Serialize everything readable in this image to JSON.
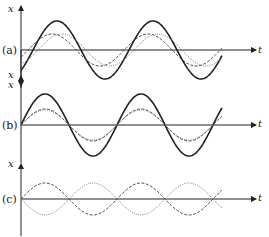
{
  "figure": {
    "panels": [
      {
        "id": "a",
        "label": "(a)",
        "y_axis_label": "x",
        "x_axis_label": "t",
        "description": "Two waves with a phase difference and their resultant (solid)",
        "axis_y": 50,
        "curves": [
          {
            "name": "resultant",
            "style": "solid",
            "amplitude": 29,
            "phase": 0.25
          },
          {
            "name": "wave-1",
            "style": "dashed",
            "amplitude": 16,
            "phase": 0.15
          },
          {
            "name": "wave-2",
            "style": "dotted",
            "amplitude": 16,
            "phase": 0.35
          }
        ]
      },
      {
        "id": "b",
        "label": "(b)",
        "y_axis_label": "x",
        "x_axis_label": "t",
        "description": "Two waves in phase (constructive interference) and their resultant (solid)",
        "axis_y": 125,
        "curves": [
          {
            "name": "resultant",
            "style": "solid",
            "amplitude": 31,
            "phase": 0
          },
          {
            "name": "wave-1",
            "style": "dashed",
            "amplitude": 16,
            "phase": 0
          },
          {
            "name": "wave-2",
            "style": "dotted",
            "amplitude": 15,
            "phase": 0
          }
        ]
      },
      {
        "id": "c",
        "label": "(c)",
        "y_axis_label": "x",
        "x_axis_label": "t",
        "description": "Two waves in antiphase (destructive interference), resultant zero",
        "axis_y": 199,
        "curves": [
          {
            "name": "wave-1",
            "style": "dashed",
            "amplitude": 16,
            "phase": 0
          },
          {
            "name": "wave-2",
            "style": "dotted",
            "amplitude": -16,
            "phase": 0
          }
        ]
      }
    ],
    "period_px": 96,
    "colors": {
      "ink": "#222222",
      "dashed": "#444444",
      "dotted": "#777777"
    }
  }
}
